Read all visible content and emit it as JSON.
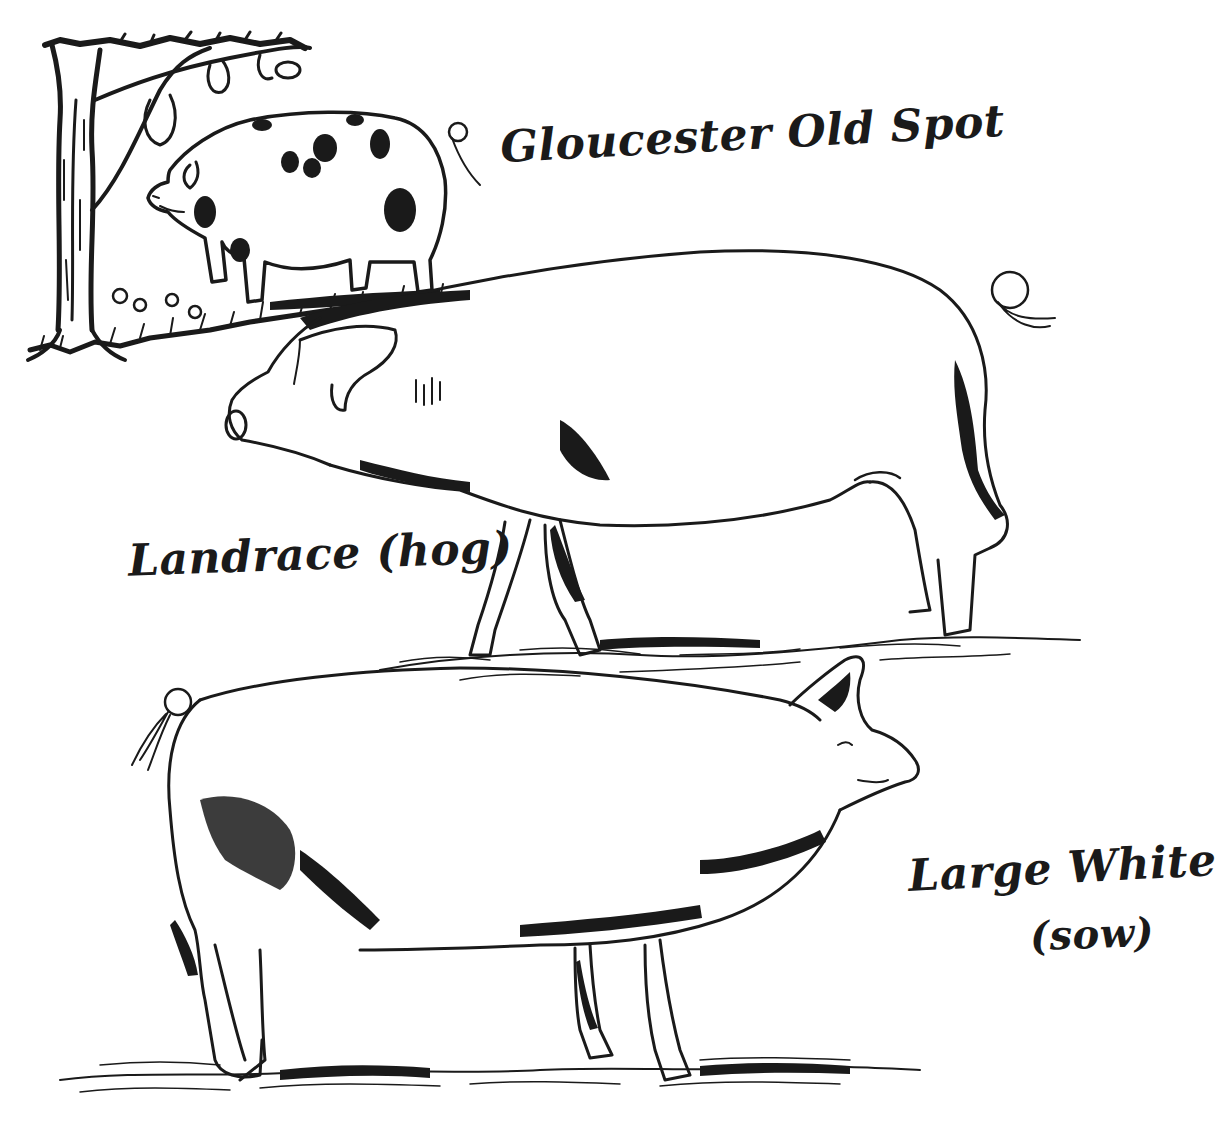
{
  "illustration": {
    "subject": "pig breeds",
    "style": "pen-and-ink",
    "ink_color": "#1a1a1a",
    "paper_color": "#ffffff"
  },
  "labels": {
    "gloucester": "Gloucester Old Spot",
    "landrace": "Landrace (hog)",
    "large_white_line1": "Large White",
    "large_white_line2": "(sow)"
  },
  "figures": [
    {
      "name": "Gloucester Old Spot",
      "features": [
        "tree",
        "spots",
        "grass"
      ]
    },
    {
      "name": "Landrace (hog)",
      "features": [
        "floppy ears",
        "long body",
        "curled tail"
      ]
    },
    {
      "name": "Large White (sow)",
      "features": [
        "erect ears",
        "upturned snout",
        "curled tail"
      ]
    }
  ]
}
